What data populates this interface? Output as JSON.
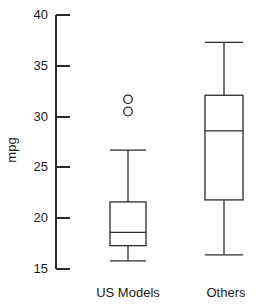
{
  "chart_data": {
    "type": "box",
    "title": "",
    "xlabel": "",
    "ylabel": "mpg",
    "ylim": [
      15,
      40
    ],
    "yticks": [
      15,
      20,
      25,
      30,
      35,
      40
    ],
    "ytick_labels": [
      "15",
      "20",
      "25",
      "30",
      "35",
      "40"
    ],
    "grid": false,
    "legend": "none",
    "categories": [
      "US Models",
      "Others"
    ],
    "boxes": [
      {
        "name": "US Models",
        "whisker_low": 15.8,
        "q1": 17.3,
        "median": 18.6,
        "q3": 21.6,
        "whisker_high": 26.7,
        "outliers": [
          31.7,
          30.5
        ]
      },
      {
        "name": "Others",
        "whisker_low": 16.4,
        "q1": 21.8,
        "median": 28.6,
        "q3": 32.1,
        "whisker_high": 37.3,
        "outliers": []
      }
    ]
  },
  "axis": {
    "y_label": "mpg",
    "tick_40": "40",
    "tick_35": "35",
    "tick_30": "30",
    "tick_25": "25",
    "tick_20": "20",
    "tick_15": "15"
  },
  "category_labels": {
    "left": "US Models",
    "right": "Others"
  },
  "colors": {
    "stroke": "#2b2b2b",
    "background": "#ffffff",
    "text": "#1a1a1a"
  }
}
